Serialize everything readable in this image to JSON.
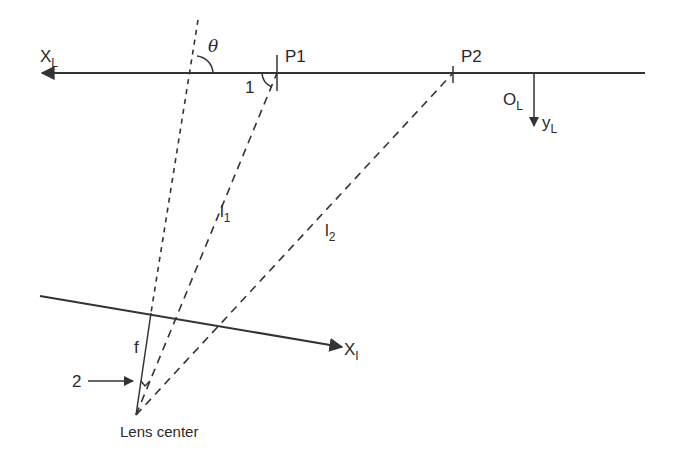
{
  "diagram": {
    "type": "geometry",
    "colors": {
      "stroke": "#333333",
      "text": "#2a2a2a",
      "background": "#ffffff"
    },
    "labels": {
      "x_axis_laser": "X",
      "x_axis_laser_sub": "L",
      "origin": "O",
      "origin_sub": "L",
      "y_axis_laser": "y",
      "y_axis_laser_sub": "L",
      "theta": "θ",
      "p1": "P1",
      "p2": "P2",
      "angle1": "1",
      "l1": "l",
      "l1_sub": "1",
      "l2": "l",
      "l2_sub": "2",
      "x_axis_image": "X",
      "x_axis_image_sub": "I",
      "focal": "f",
      "marker2": "2",
      "lens_center": "Lens center"
    },
    "nodes": [
      {
        "id": "lens-center",
        "x": 136,
        "y": 415
      },
      {
        "id": "P1",
        "x": 277,
        "y": 73
      },
      {
        "id": "P2",
        "x": 453,
        "y": 73
      },
      {
        "id": "O_L",
        "x": 534,
        "y": 73
      }
    ],
    "edges": [
      {
        "from": "lens-center",
        "to": "P1",
        "label": "l1",
        "style": "dashed"
      },
      {
        "from": "lens-center",
        "to": "P2",
        "label": "l2",
        "style": "dashed"
      },
      {
        "from": "lens-center",
        "to": "optical-axis-top",
        "label": "f",
        "style": "solid-then-dotted"
      }
    ]
  }
}
